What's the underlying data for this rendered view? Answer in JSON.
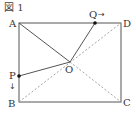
{
  "figure": {
    "title": "図 1",
    "points": {
      "A": {
        "label": "A",
        "x": 19,
        "y": 23
      },
      "B": {
        "label": "B",
        "x": 19,
        "y": 102
      },
      "C": {
        "label": "C",
        "x": 121,
        "y": 102
      },
      "D": {
        "label": "D",
        "x": 121,
        "y": 23
      },
      "O": {
        "label": "O",
        "x": 70,
        "y": 62
      },
      "P": {
        "label": "P",
        "x": 19,
        "y": 76
      },
      "Q": {
        "label": "Q",
        "x": 95,
        "y": 23
      }
    },
    "arrows": {
      "Q": "→",
      "P": "↓"
    },
    "colors": {
      "line": "#555555",
      "dashed": "#999999",
      "dot": "#111111"
    }
  }
}
